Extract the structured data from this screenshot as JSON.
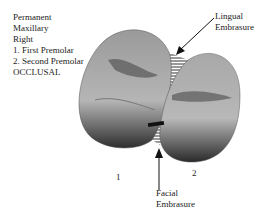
{
  "caption": {
    "lines": [
      "Permanent",
      "Maxillary",
      "Right",
      "1. First Premolar",
      "2. Second Premolar",
      "OCCLUSAL"
    ]
  },
  "labels": {
    "lingual": [
      "Lingual",
      "Embrasure"
    ],
    "facial": [
      "Facial",
      "Embrasure"
    ],
    "tooth1": "1",
    "tooth2": "2"
  },
  "colors": {
    "tooth_light": "#b8b8b8",
    "tooth_mid": "#8a8a8a",
    "tooth_dark": "#3a3a3a",
    "hatch": "#333333"
  }
}
